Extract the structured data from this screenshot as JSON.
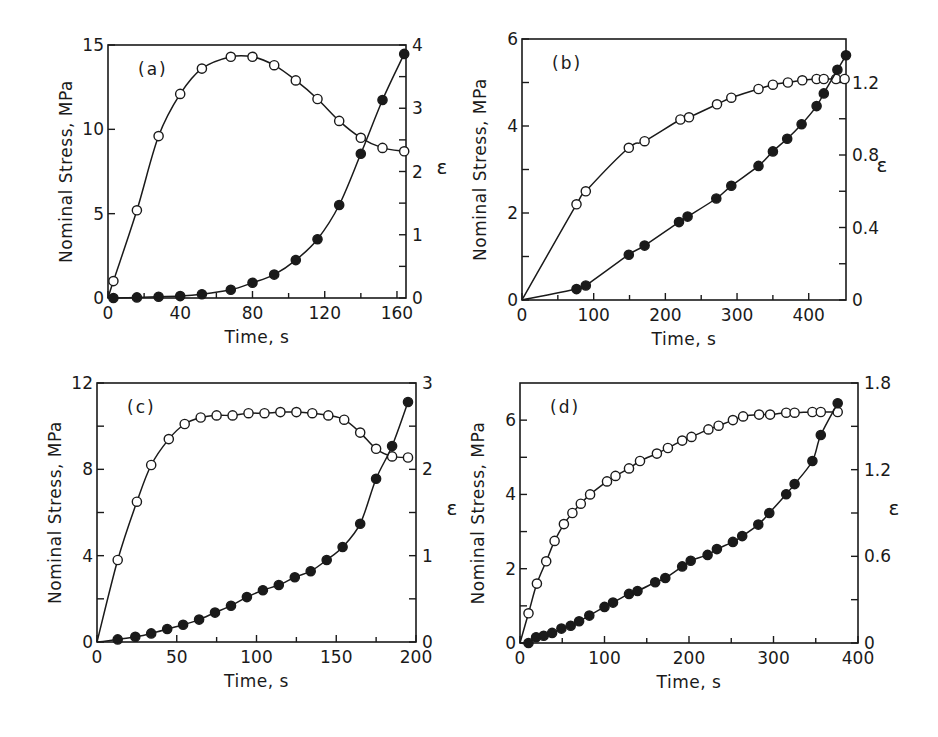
{
  "figure": {
    "background": "#ffffff",
    "ink": "#1a1a1a"
  },
  "chart_data": [
    {
      "id": "a",
      "panel_label": "(a)",
      "type": "line",
      "frame": {
        "left": 108,
        "top": 45,
        "right": 406,
        "bottom": 298
      },
      "xlabel": "Time, s",
      "ylabel": "Nominal Stress, MPa",
      "ylabel_right": "ε",
      "xlim": [
        0,
        165
      ],
      "ylim": [
        0,
        15
      ],
      "ylim_right": [
        0,
        4
      ],
      "xticks": [
        0,
        40,
        80,
        120,
        160
      ],
      "xminor": [
        20,
        60,
        100,
        140
      ],
      "yticks": [
        0,
        5,
        10,
        15
      ],
      "yminor": [],
      "yticks_right": [
        0,
        1,
        2,
        3,
        4
      ],
      "yticks_right_labels": [
        "0",
        "1",
        "2",
        "3",
        "4"
      ],
      "yminor_right": [
        0.5,
        1.5,
        2.5,
        3.5
      ],
      "grid": false,
      "series": [
        {
          "name": "Nominal stress",
          "axis": "left",
          "marker": "open-circle",
          "x": [
            0,
            3,
            16,
            28,
            40,
            52,
            68,
            80,
            92,
            104,
            116,
            128,
            140,
            152,
            164
          ],
          "y": [
            0,
            1.0,
            5.2,
            9.6,
            12.1,
            13.6,
            14.3,
            14.3,
            13.8,
            12.9,
            11.8,
            10.5,
            9.5,
            8.9,
            8.7
          ],
          "markers_from": 1
        },
        {
          "name": "Strain ε",
          "axis": "right",
          "marker": "filled-circle",
          "x": [
            0,
            3,
            16,
            28,
            40,
            52,
            68,
            80,
            92,
            104,
            116,
            128,
            140,
            152,
            164
          ],
          "y": [
            0,
            0,
            0.01,
            0.02,
            0.03,
            0.06,
            0.13,
            0.24,
            0.37,
            0.6,
            0.93,
            1.47,
            2.28,
            3.13,
            3.86
          ],
          "markers_from": 1
        }
      ]
    },
    {
      "id": "b",
      "panel_label": "(b)",
      "type": "line",
      "frame": {
        "left": 522,
        "top": 39,
        "right": 846,
        "bottom": 300
      },
      "xlabel": "Time, s",
      "ylabel": "Nominal Stress, MPa",
      "ylabel_right": "ε",
      "xlim": [
        0,
        452
      ],
      "ylim": [
        0,
        6
      ],
      "ylim_right": [
        0,
        1.44
      ],
      "xticks": [
        0,
        100,
        200,
        300,
        400
      ],
      "xminor": [
        50,
        150,
        250,
        350
      ],
      "yticks": [
        0,
        2,
        4,
        6
      ],
      "yminor": [
        1,
        3,
        5
      ],
      "yticks_right": [
        0,
        0.4,
        0.8,
        1.2
      ],
      "yticks_right_labels": [
        "0",
        "0.4",
        "0.8",
        "1.2"
      ],
      "yminor_right": [
        0.2,
        0.6,
        1.0
      ],
      "grid": false,
      "series": [
        {
          "name": "Nominal stress",
          "axis": "left",
          "marker": "open-circle",
          "x": [
            0,
            76,
            89,
            149,
            171,
            221,
            233,
            272,
            292,
            330,
            350,
            371,
            391,
            411,
            421,
            438,
            450
          ],
          "y": [
            0,
            2.2,
            2.5,
            3.5,
            3.65,
            4.15,
            4.2,
            4.5,
            4.65,
            4.85,
            4.95,
            5.0,
            5.05,
            5.08,
            5.08,
            5.08,
            5.08
          ],
          "markers_from": 1
        },
        {
          "name": "Strain ε",
          "axis": "right",
          "marker": "filled-circle",
          "x": [
            0,
            76,
            89,
            149,
            171,
            219,
            231,
            271,
            292,
            330,
            350,
            370,
            390,
            411,
            421,
            440,
            452
          ],
          "y": [
            0,
            0.06,
            0.08,
            0.25,
            0.3,
            0.43,
            0.46,
            0.56,
            0.63,
            0.74,
            0.82,
            0.89,
            0.97,
            1.07,
            1.14,
            1.27,
            1.35
          ],
          "markers_from": 1
        }
      ]
    },
    {
      "id": "c",
      "panel_label": "(c)",
      "type": "line",
      "frame": {
        "left": 97,
        "top": 383,
        "right": 416,
        "bottom": 642
      },
      "xlabel": "Time, s",
      "ylabel": "Nominal Stress, MPa",
      "ylabel_right": "ε",
      "xlim": [
        0,
        200
      ],
      "ylim": [
        0,
        12
      ],
      "ylim_right": [
        0,
        3
      ],
      "xticks": [
        0,
        50,
        100,
        150,
        200
      ],
      "xminor": [
        25,
        75,
        125,
        175
      ],
      "yticks": [
        0,
        4,
        8,
        12
      ],
      "yminor": [
        2,
        6,
        10
      ],
      "yticks_right": [
        0,
        1,
        2,
        3
      ],
      "yticks_right_labels": [
        "0",
        "1",
        "2",
        "3"
      ],
      "yminor_right": [
        0.5,
        1.5,
        2.5
      ],
      "grid": false,
      "series": [
        {
          "name": "Nominal stress",
          "axis": "left",
          "marker": "open-circle",
          "x": [
            0,
            13,
            25,
            34,
            45,
            55,
            65,
            75,
            85,
            95,
            105,
            115,
            125,
            135,
            145,
            155,
            165,
            175,
            185,
            195
          ],
          "y": [
            0,
            3.8,
            6.5,
            8.2,
            9.4,
            10.1,
            10.4,
            10.5,
            10.5,
            10.6,
            10.6,
            10.65,
            10.65,
            10.6,
            10.5,
            10.3,
            9.7,
            8.95,
            8.6,
            8.55
          ],
          "markers_from": 1
        },
        {
          "name": "Strain ε",
          "axis": "right",
          "marker": "filled-circle",
          "x": [
            0,
            13,
            24,
            34,
            44,
            54,
            64,
            74,
            84,
            94,
            104,
            114,
            124,
            134,
            144,
            154,
            165,
            175,
            185,
            195
          ],
          "y": [
            0,
            0.03,
            0.06,
            0.1,
            0.15,
            0.2,
            0.26,
            0.34,
            0.42,
            0.52,
            0.6,
            0.66,
            0.75,
            0.82,
            0.95,
            1.1,
            1.37,
            1.89,
            2.27,
            2.78
          ],
          "markers_from": 1
        }
      ]
    },
    {
      "id": "d",
      "panel_label": "(d)",
      "type": "line",
      "frame": {
        "left": 520,
        "top": 383,
        "right": 858,
        "bottom": 643
      },
      "xlabel": "Time, s",
      "ylabel": "Nominal Stress, MPa",
      "ylabel_right": "ε",
      "xlim": [
        0,
        400
      ],
      "ylim": [
        0,
        7
      ],
      "ylim_right": [
        0,
        1.8
      ],
      "xticks": [
        0,
        100,
        200,
        300,
        400
      ],
      "xminor": [
        50,
        150,
        250,
        350
      ],
      "yticks": [
        0,
        2,
        4,
        6
      ],
      "yminor": [
        1,
        3,
        5
      ],
      "yticks_right": [
        0,
        0.6,
        1.2,
        1.8
      ],
      "yticks_right_labels": [
        "0",
        "0.6",
        "1.2",
        "1.8"
      ],
      "yminor_right": [
        0.3,
        0.9,
        1.5
      ],
      "grid": false,
      "series": [
        {
          "name": "Nominal stress",
          "axis": "left",
          "marker": "open-circle",
          "x": [
            0,
            10,
            20,
            31,
            41,
            52,
            62,
            72,
            83,
            103,
            113,
            129,
            142,
            162,
            175,
            192,
            203,
            223,
            235,
            252,
            264,
            283,
            296,
            315,
            325,
            346,
            356,
            376
          ],
          "y": [
            0,
            0.8,
            1.6,
            2.2,
            2.75,
            3.2,
            3.5,
            3.75,
            4.0,
            4.35,
            4.5,
            4.7,
            4.9,
            5.1,
            5.25,
            5.45,
            5.55,
            5.75,
            5.85,
            6.0,
            6.1,
            6.15,
            6.15,
            6.2,
            6.2,
            6.22,
            6.22,
            6.22
          ],
          "markers_from": 1
        },
        {
          "name": "Strain ε",
          "axis": "right",
          "marker": "filled-circle",
          "x": [
            0,
            10,
            19,
            28,
            38,
            49,
            60,
            70,
            82,
            100,
            110,
            129,
            139,
            160,
            172,
            192,
            202,
            222,
            233,
            252,
            263,
            282,
            295,
            315,
            325,
            346,
            356,
            376
          ],
          "y": [
            0,
            0.0,
            0.04,
            0.05,
            0.07,
            0.1,
            0.12,
            0.15,
            0.19,
            0.25,
            0.28,
            0.34,
            0.36,
            0.42,
            0.45,
            0.53,
            0.57,
            0.61,
            0.65,
            0.7,
            0.74,
            0.82,
            0.9,
            1.03,
            1.1,
            1.26,
            1.44,
            1.66
          ],
          "markers_from": 1
        }
      ]
    }
  ]
}
